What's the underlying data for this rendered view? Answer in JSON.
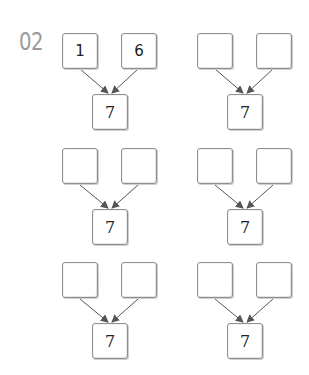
{
  "exercise_number": "02",
  "colors": {
    "number": "#9a9a9a",
    "box_border": "#8f8f8f",
    "arrow": "#555555"
  },
  "groups": [
    {
      "left": "1",
      "right": "6",
      "total": "7"
    },
    {
      "left": "",
      "right": "",
      "total": "7"
    },
    {
      "left": "",
      "right": "",
      "total": "7"
    },
    {
      "left": "",
      "right": "",
      "total": "7"
    },
    {
      "left": "",
      "right": "",
      "total": "7"
    },
    {
      "left": "",
      "right": "",
      "total": "7"
    }
  ]
}
